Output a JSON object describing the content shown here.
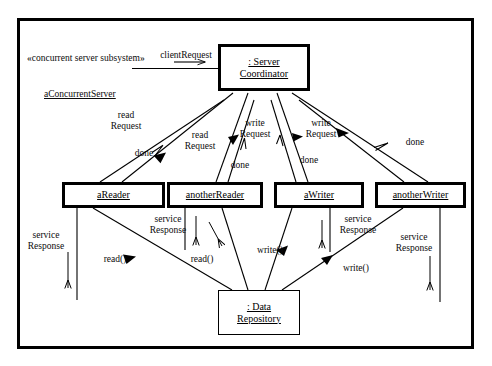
{
  "diagram": {
    "kind": "uml-concurrent-collaboration-diagram",
    "frame": {
      "stereotype": "«concurrent server subsystem»",
      "instance_name": "aConcurrentServer"
    },
    "objects": [
      {
        "id": "server-coordinator",
        "line1": ": Server",
        "line2": "Coordinator",
        "active": true
      },
      {
        "id": "areader",
        "line1": "aReader",
        "line2": "",
        "active": true
      },
      {
        "id": "anotherreader",
        "line1": "anotherReader",
        "line2": "",
        "active": true
      },
      {
        "id": "awriter",
        "line1": "aWriter",
        "line2": "",
        "active": true
      },
      {
        "id": "anotherwriter",
        "line1": "anotherWriter",
        "line2": "",
        "active": true
      },
      {
        "id": "data-repository",
        "line1": ": Data",
        "line2": "Repository",
        "active": false
      }
    ],
    "messages": [
      {
        "id": "client-request",
        "line1": "clientRequest",
        "line2": ""
      },
      {
        "id": "read-request-left",
        "line1": "read",
        "line2": "Request"
      },
      {
        "id": "done-left",
        "line1": "done",
        "line2": ""
      },
      {
        "id": "read-request-mid",
        "line1": "read",
        "line2": "Request"
      },
      {
        "id": "done-mid",
        "line1": "done",
        "line2": ""
      },
      {
        "id": "write-request-mid",
        "line1": "write",
        "line2": "Request"
      },
      {
        "id": "done-write-mid",
        "line1": "done",
        "line2": ""
      },
      {
        "id": "write-request-right",
        "line1": "write",
        "line2": "Request"
      },
      {
        "id": "done-right",
        "line1": "done",
        "line2": ""
      },
      {
        "id": "service-response-1",
        "line1": "service",
        "line2": "Response"
      },
      {
        "id": "read-call-1",
        "line1": "read()",
        "line2": ""
      },
      {
        "id": "service-response-2",
        "line1": "service",
        "line2": "Response"
      },
      {
        "id": "read-call-2",
        "line1": "read()",
        "line2": ""
      },
      {
        "id": "write-call-1",
        "line1": "write()",
        "line2": ""
      },
      {
        "id": "service-response-3",
        "line1": "service",
        "line2": "Response"
      },
      {
        "id": "write-call-2",
        "line1": "write()",
        "line2": ""
      },
      {
        "id": "service-response-4",
        "line1": "service",
        "line2": "Response"
      }
    ],
    "colors": {
      "ink": "#000000",
      "background": "#ffffff"
    }
  }
}
